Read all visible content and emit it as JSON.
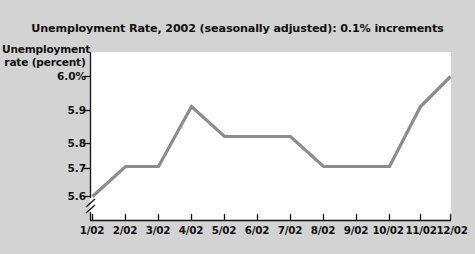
{
  "chart_data": {
    "type": "line",
    "title": "Unemployment Rate, 2002 (seasonally adjusted): 0.1% increments",
    "xlabel": "Month",
    "ylabel": "Unemployment rate (percent)",
    "ylabel_line1": "Unemployment",
    "ylabel_line2": "rate (percent)",
    "categories": [
      "1/02",
      "2/02",
      "3/02",
      "4/02",
      "5/02",
      "6/02",
      "7/02",
      "8/02",
      "9/02",
      "10/02",
      "11/02",
      "12/02"
    ],
    "values": [
      5.6,
      5.7,
      5.7,
      5.9,
      5.8,
      5.8,
      5.8,
      5.7,
      5.7,
      5.7,
      5.9,
      6.0
    ],
    "ytick_labels": [
      "6.0%",
      "5.9",
      "5.8",
      "5.7",
      "5.6"
    ],
    "ytick_values": [
      6.0,
      5.9,
      5.8,
      5.7,
      5.6
    ],
    "ylim": [
      5.55,
      6.03
    ],
    "grid": false,
    "legend": false,
    "axis_break": true,
    "series_color": "#8c8c8c",
    "plot_background": "#ffffff",
    "figure_background": "#d3d3d3",
    "text_color": "#111111"
  }
}
